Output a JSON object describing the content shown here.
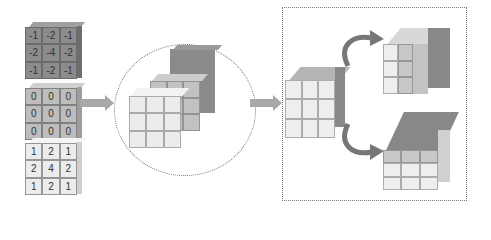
{
  "diagram": {
    "kernels": [
      {
        "name": "kernel-slice-negative",
        "shade": "dark",
        "values": [
          "-1",
          "-2",
          "-1",
          "-2",
          "-4",
          "-2",
          "-1",
          "-2",
          "-1"
        ]
      },
      {
        "name": "kernel-slice-zero",
        "shade": "mid",
        "values": [
          "0",
          "0",
          "0",
          "0",
          "0",
          "0",
          "0",
          "0",
          "0"
        ]
      },
      {
        "name": "kernel-slice-positive",
        "shade": "light",
        "values": [
          "1",
          "2",
          "1",
          "2",
          "4",
          "2",
          "1",
          "2",
          "1"
        ]
      }
    ],
    "colors": {
      "dark": "#8c8c8c",
      "mid": "#bdbdbd",
      "light": "#ececec",
      "arrow": "#a8a8a8",
      "border": "#777777"
    },
    "stages": [
      "kernel-slices",
      "stacked-3d-kernel",
      "rotated-kernel-variants"
    ]
  }
}
